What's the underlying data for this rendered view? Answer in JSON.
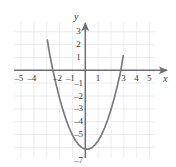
{
  "figure": {
    "kind": "cartesian-graph",
    "width": 176,
    "height": 167,
    "background": "#ffffff"
  },
  "colors": {
    "grid_minor": "#e9e9ec",
    "grid_major": "#d9d9de",
    "axis": "#6f6f73",
    "curve": "#7b7b80",
    "text": "#3a3a3a"
  },
  "chart_data": {
    "type": "line",
    "title": "",
    "xlabel": "x",
    "ylabel": "y",
    "xlim": [
      -6.1,
      5.6
    ],
    "ylim": [
      -7.6,
      3.9
    ],
    "grid": true,
    "grid_step": 1,
    "legend": null,
    "x_tick_labels": [
      "–5",
      "–4",
      "–2",
      "–1",
      "1",
      "3",
      "4",
      "5"
    ],
    "x_tick_values": [
      -5,
      -4,
      -2,
      -1,
      1,
      3,
      4,
      5
    ],
    "y_tick_labels": [
      "3",
      "2",
      "1",
      "–1",
      "–2",
      "–3",
      "–4",
      "–5",
      "–7"
    ],
    "y_tick_values": [
      3,
      2,
      1,
      -1,
      -2,
      -3,
      -4,
      -5,
      -7
    ],
    "series": [
      {
        "name": "parabola",
        "equation_display": "y = x² – 6.3",
        "vertex": [
          -0.1,
          -6.35
        ],
        "x_intercepts": [
          -2.42,
          2.42
        ],
        "y_intercept": -6.35,
        "x": [
          -2.95,
          -2.75,
          -2.5,
          -2.25,
          -2.0,
          -1.75,
          -1.5,
          -1.25,
          -1.0,
          -0.75,
          -0.5,
          -0.25,
          0.0,
          0.25,
          0.5,
          0.75,
          1.0,
          1.25,
          1.5,
          1.75,
          2.0,
          2.25,
          2.5,
          2.75,
          2.95
        ],
        "y": [
          2.35,
          1.12,
          -0.09,
          -1.19,
          -2.18,
          -3.06,
          -3.83,
          -4.49,
          -5.04,
          -5.48,
          -5.81,
          -6.03,
          -6.14,
          -6.14,
          -6.03,
          -5.81,
          -5.48,
          -5.04,
          -4.49,
          -3.83,
          -3.06,
          -2.18,
          -1.19,
          -0.09,
          1.12
        ]
      }
    ]
  },
  "axis_labels": {
    "x": "x",
    "y": "y"
  }
}
